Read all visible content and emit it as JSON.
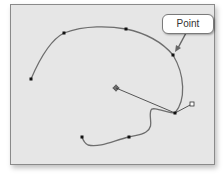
{
  "callout": {
    "label": "Point"
  },
  "colors": {
    "canvas_bg": "#e6e6e6",
    "frame_border": "#8a8a8a",
    "path_stroke": "#6e6e6e",
    "anchor_fill": "#111111",
    "handle_line": "#555555"
  },
  "path": {
    "anchor_points": [
      {
        "x": 31,
        "y": 79,
        "type": "end-point"
      },
      {
        "x": 64,
        "y": 33,
        "type": "anchor"
      },
      {
        "x": 126,
        "y": 29,
        "type": "anchor"
      },
      {
        "x": 173,
        "y": 55,
        "type": "selected-anchor"
      },
      {
        "x": 175,
        "y": 113,
        "type": "corner-anchor"
      },
      {
        "x": 129,
        "y": 137,
        "type": "anchor"
      },
      {
        "x": 82,
        "y": 137,
        "type": "end-point"
      }
    ],
    "direction_handles": [
      {
        "x": 116,
        "y": 88,
        "type": "handle-crosshair"
      },
      {
        "x": 192,
        "y": 104,
        "type": "handle-hollow"
      }
    ]
  }
}
